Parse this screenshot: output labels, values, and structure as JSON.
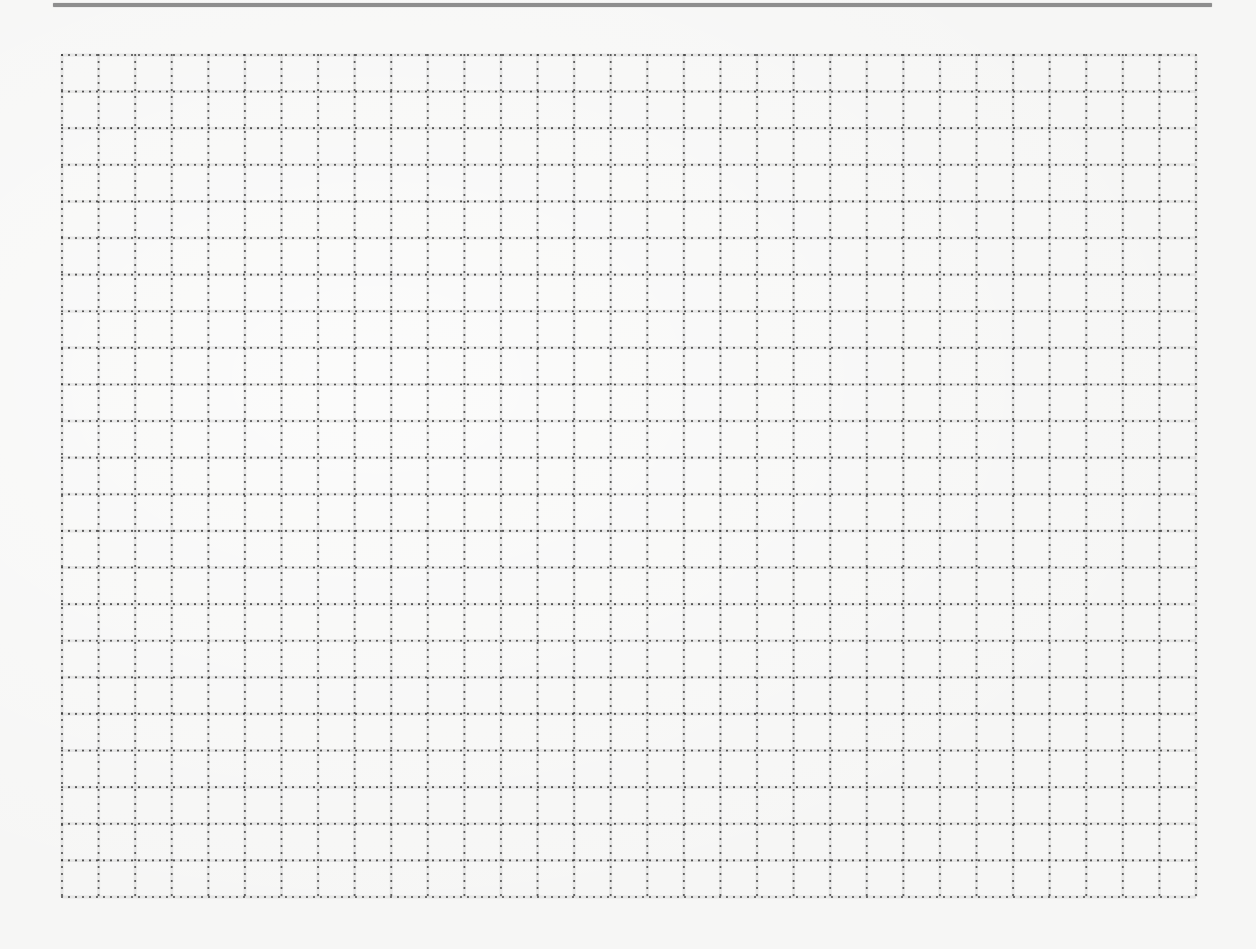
{
  "page": {
    "type": "dotted-grid-worksheet",
    "background_color": "#f6f6f5",
    "top_rule": {
      "color": "#8e8e8e"
    },
    "grid": {
      "left": 62,
      "top": 55,
      "right": 1196,
      "bottom": 897,
      "columns": 31,
      "rows": 23,
      "line_color": "#3a3a3a",
      "line_style": "dotted",
      "dot_spacing": 7,
      "dot_radius": 1.1
    }
  }
}
